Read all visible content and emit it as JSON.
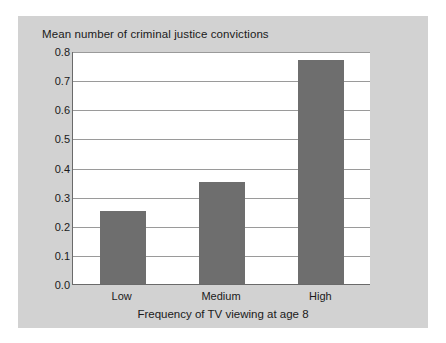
{
  "chart_data": {
    "type": "bar",
    "title": "Mean number of criminal justice convictions",
    "xlabel": "Frequency of TV viewing at age 8",
    "ylabel": "",
    "categories": [
      "Low",
      "Medium",
      "High"
    ],
    "values": [
      0.25,
      0.35,
      0.77
    ],
    "ylim": [
      0.0,
      0.8
    ],
    "ytick_labels": [
      "0.0",
      "0.1",
      "0.2",
      "0.3",
      "0.4",
      "0.5",
      "0.6",
      "0.7",
      "0.8"
    ],
    "ytick_values": [
      0.0,
      0.1,
      0.2,
      0.3,
      0.4,
      0.5,
      0.6,
      0.7,
      0.8
    ],
    "grid": true,
    "legend": null,
    "colors": {
      "bar": "#6e6e6e",
      "panel_background": "#d2d2d2",
      "plot_background": "#ffffff",
      "gridline": "#9a9a9a",
      "axis": "#6a6a6a",
      "text": "#1a1a1a"
    }
  }
}
